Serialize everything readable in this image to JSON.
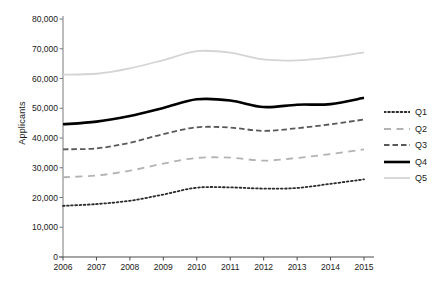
{
  "chart_data": {
    "type": "line",
    "title": "",
    "xlabel": "",
    "ylabel": "Applicants",
    "categories": [
      "2006",
      "2007",
      "2008",
      "2009",
      "2010",
      "2011",
      "2012",
      "2013",
      "2014",
      "2015"
    ],
    "x": [
      2006,
      2007,
      2008,
      2009,
      2010,
      2011,
      2012,
      2013,
      2014,
      2015
    ],
    "ylim": [
      0,
      80000
    ],
    "xlim": [
      2006,
      2015
    ],
    "ytick_labels": [
      "0",
      "10,000",
      "20,000",
      "30,000",
      "40,000",
      "50,000",
      "60,000",
      "70,000",
      "80,000"
    ],
    "ytick_values": [
      0,
      10000,
      20000,
      30000,
      40000,
      50000,
      60000,
      70000,
      80000
    ],
    "grid": false,
    "legend_position": "right",
    "series": [
      {
        "name": "Q1",
        "style": "dotted",
        "color": "#2b2b2b",
        "width": 1.8,
        "values": [
          17200,
          17800,
          18900,
          21000,
          23300,
          23400,
          23000,
          23200,
          24600,
          26100
        ]
      },
      {
        "name": "Q2",
        "style": "dashed-long",
        "color": "#b3b3b3",
        "width": 1.8,
        "values": [
          26800,
          27400,
          29000,
          31400,
          33300,
          33400,
          32400,
          33300,
          34600,
          36200
        ]
      },
      {
        "name": "Q3",
        "style": "dashed",
        "color": "#595959",
        "width": 1.8,
        "values": [
          36200,
          36500,
          38400,
          41300,
          43600,
          43500,
          42400,
          43300,
          44600,
          46200
        ]
      },
      {
        "name": "Q4",
        "style": "solid",
        "color": "#000000",
        "width": 2.6,
        "values": [
          44600,
          45500,
          47400,
          50100,
          53000,
          52600,
          50400,
          51200,
          51400,
          53500
        ]
      },
      {
        "name": "Q5",
        "style": "solid",
        "color": "#d4d4d4",
        "width": 1.8,
        "values": [
          61300,
          61600,
          63400,
          66200,
          69200,
          68700,
          66400,
          66100,
          67100,
          68800
        ]
      }
    ]
  },
  "legend": {
    "items": [
      {
        "label": "Q1"
      },
      {
        "label": "Q2"
      },
      {
        "label": "Q3"
      },
      {
        "label": "Q4"
      },
      {
        "label": "Q5"
      }
    ]
  }
}
